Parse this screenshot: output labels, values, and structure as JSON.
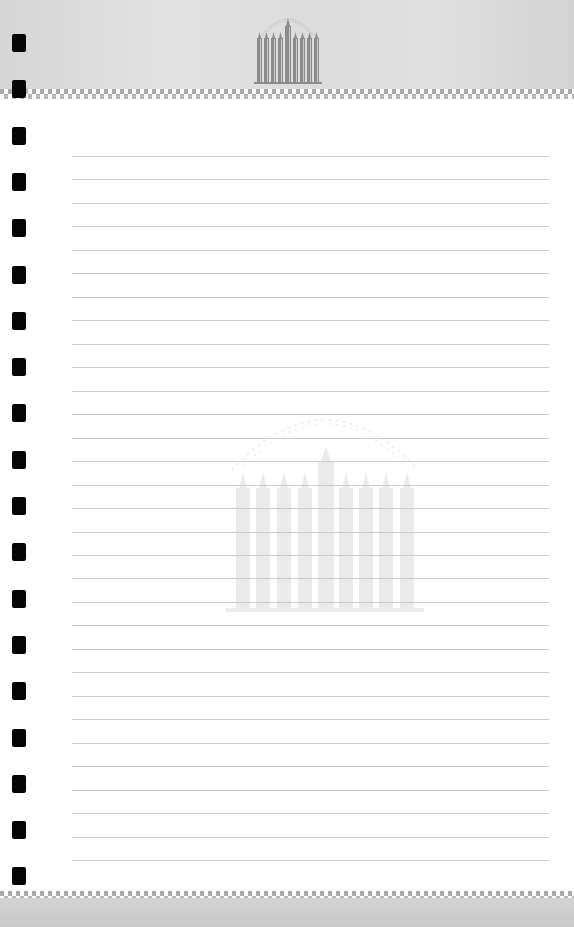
{
  "notepad": {
    "type": "lined-notepad-sheet",
    "emblem": "menorah-icon",
    "colors": {
      "header_bg": "#dcdcdc",
      "paper_bg": "#ffffff",
      "rule_line": "#cccccc",
      "punch_hole": "#050505",
      "emblem": "#8a8a8a"
    },
    "rule_count": 31,
    "punch_hole_count": 19,
    "lines": [
      "",
      "",
      "",
      "",
      "",
      "",
      "",
      "",
      "",
      "",
      "",
      "",
      "",
      "",
      "",
      "",
      "",
      "",
      "",
      "",
      "",
      "",
      "",
      "",
      "",
      "",
      "",
      "",
      "",
      "",
      ""
    ]
  }
}
